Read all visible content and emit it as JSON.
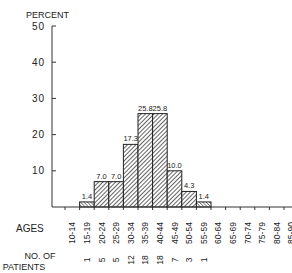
{
  "chart_data": {
    "type": "bar",
    "title": "",
    "ylabel": "PERCENT",
    "xlabel": "AGES",
    "ylim": [
      0,
      50
    ],
    "yticks": [
      10,
      20,
      30,
      40,
      50
    ],
    "grid": false,
    "legend": null,
    "bar_style": "diagonal hatch",
    "categories": [
      "10-14",
      "15-19",
      "20-24",
      "25-29",
      "30-34",
      "35-39",
      "40-44",
      "45-49",
      "50-54",
      "55-59",
      "60-64",
      "65-69",
      "70-74",
      "75-79",
      "80-84",
      "85-90"
    ],
    "values": [
      0,
      1.4,
      7.0,
      7.0,
      17.3,
      25.8,
      25.8,
      10.0,
      4.3,
      1.4,
      0,
      0,
      0,
      0,
      0,
      0
    ],
    "value_labels": [
      "",
      "1.4",
      "7.0",
      "7.0",
      "17.3",
      "25.8",
      "25.8",
      "10.0",
      "4.3",
      "1.4",
      "",
      "",
      "",
      "",
      "",
      ""
    ],
    "secondary_row": {
      "label": "NO. OF PATIENTS",
      "values": [
        "",
        "1",
        "5",
        "5",
        "12",
        "18",
        "18",
        "7",
        "3",
        "1",
        "",
        "",
        "",
        "",
        "",
        ""
      ]
    }
  }
}
